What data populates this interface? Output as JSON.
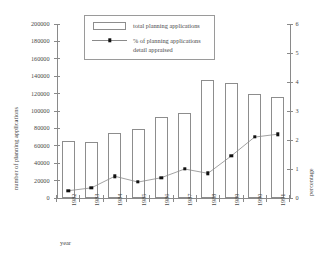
{
  "chart_data": {
    "type": "bar",
    "title": "",
    "subtitle": "",
    "categories": [
      "1982",
      "1983",
      "1984",
      "1985",
      "1986",
      "1987",
      "1988",
      "1989",
      "1990",
      "1991"
    ],
    "xlabel": "year",
    "ylabel": "number of planning applications",
    "y2label": "percentage",
    "ylim": [
      0,
      200000
    ],
    "y2lim": [
      0,
      6
    ],
    "yticks": [
      "0",
      "20000",
      "40000",
      "60000",
      "80000",
      "100000",
      "120000",
      "140000",
      "160000",
      "180000",
      "200000"
    ],
    "ytick_values": [
      0,
      20000,
      40000,
      60000,
      80000,
      100000,
      120000,
      140000,
      160000,
      180000,
      200000
    ],
    "y2ticks": [
      "0",
      "1",
      "2",
      "3",
      "4",
      "5",
      "6"
    ],
    "y2tick_values": [
      0,
      1,
      2,
      3,
      4,
      5,
      6
    ],
    "grid": false,
    "legend_position": "top-center",
    "series": [
      {
        "name": "total planning  applications",
        "type": "bar",
        "axis": "left",
        "values": [
          66000,
          64000,
          75000,
          79000,
          93000,
          98000,
          136000,
          132000,
          119000,
          116000
        ]
      },
      {
        "name": "% of planning applications detail appraised",
        "type": "line",
        "axis": "right",
        "values": [
          0.25,
          0.35,
          0.75,
          0.55,
          0.7,
          1.0,
          0.85,
          1.45,
          2.1,
          2.2
        ]
      }
    ]
  },
  "legend": {
    "entries": [
      {
        "label_line1": "total planning  applications",
        "label_line2": "",
        "marker": "bar-swatch"
      },
      {
        "label_line1": "% of planning applications",
        "label_line2": "detail appraised",
        "marker": "line-marker"
      }
    ]
  },
  "colors": {
    "axis": "#8a8a8a",
    "bar_stroke": "#8d8d8d",
    "bar_fill": "#ffffff",
    "line": "#8a8a8a",
    "marker": "#111111",
    "text": "#4a4a4a",
    "background": "#ffffff"
  }
}
